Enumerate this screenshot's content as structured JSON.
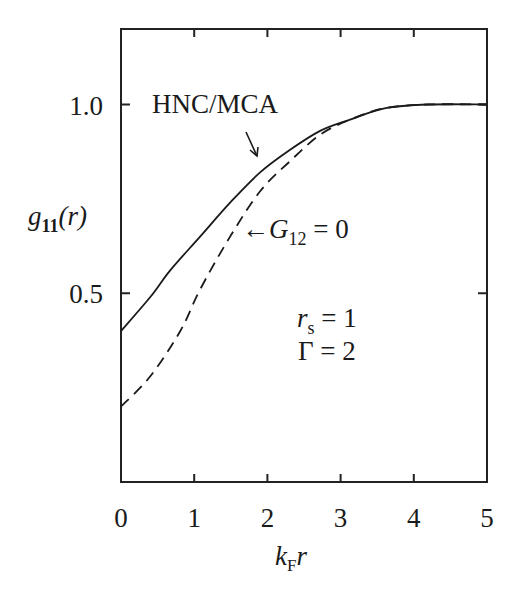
{
  "chart_data": {
    "type": "line",
    "title": "",
    "xlabel": "k_F r",
    "ylabel": "g_11(r)",
    "xlim": [
      0,
      5
    ],
    "ylim": [
      0,
      1.2
    ],
    "x_ticks": [
      0,
      1,
      2,
      3,
      4,
      5
    ],
    "x_tick_labels": [
      "0",
      "1",
      "2",
      "3",
      "4",
      "5"
    ],
    "y_ticks": [
      0.5,
      1.0
    ],
    "y_tick_labels": [
      "0.5",
      "1.0"
    ],
    "grid": false,
    "legend": "inline annotations",
    "series": [
      {
        "name": "HNC/MCA",
        "style": "solid",
        "x": [
          0,
          0.4,
          0.67,
          1.08,
          1.49,
          1.9,
          2.31,
          2.72,
          3.13,
          3.6,
          4.2,
          5.0
        ],
        "values": [
          0.4,
          0.49,
          0.56,
          0.65,
          0.74,
          0.82,
          0.88,
          0.93,
          0.96,
          0.99,
          1.0,
          1.0
        ]
      },
      {
        "name": "G12 = 0",
        "style": "dashed",
        "x": [
          0,
          0.4,
          0.81,
          1.08,
          1.49,
          1.9,
          2.31,
          2.72,
          3.13,
          3.6,
          4.2,
          5.0
        ],
        "values": [
          0.2,
          0.28,
          0.4,
          0.51,
          0.65,
          0.77,
          0.85,
          0.92,
          0.96,
          0.99,
          1.0,
          1.0
        ]
      }
    ],
    "annotations": [
      {
        "text": "HNC/MCA",
        "arrow": "down-right to solid curve at k_F r≈1.8"
      },
      {
        "text": "← G12 = 0",
        "arrow": "left to dashed curve at k_F r≈1.5"
      },
      {
        "text": "r_s = 1"
      },
      {
        "text": "Γ = 2"
      }
    ]
  },
  "labels": {
    "ylabel_main": "g",
    "ylabel_sub": "11",
    "ylabel_tail": "(r)",
    "xlabel_main": "k",
    "xlabel_sub": "F",
    "xlabel_tail": "r",
    "hnc": "HNC/MCA",
    "g12_arrow": "←",
    "g12_main": "G",
    "g12_sub": "12",
    "g12_tail": " = 0",
    "rs_main": "r",
    "rs_sub": "s",
    "rs_tail": " = 1",
    "gamma": "Γ = 2"
  }
}
